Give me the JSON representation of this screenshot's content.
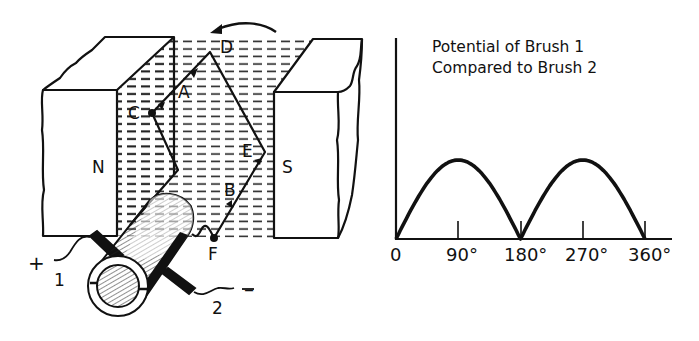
{
  "diagram": {
    "generator": {
      "magnets": {
        "north_label": "N",
        "south_label": "S"
      },
      "loop_points": {
        "A": "A",
        "B": "B",
        "C": "C",
        "D": "D",
        "E": "E",
        "F": "F"
      },
      "brushes": {
        "brush1_label": "1",
        "brush2_label": "2",
        "positive_sign": "+",
        "negative_sign": "–"
      },
      "rotation_arrow": "counterclockwise-arrow"
    },
    "colors": {
      "ink": "#111111",
      "background": "#ffffff"
    }
  },
  "chart_data": {
    "type": "line",
    "title": "Potential of Brush 1 Compared to Brush 2",
    "title_lines": [
      "Potential of Brush 1",
      "Compared to Brush 2"
    ],
    "xlabel": "",
    "ylabel": "",
    "x_ticks": [
      "0",
      "90°",
      "180°",
      "270°",
      "360°"
    ],
    "x": [
      0,
      30,
      60,
      90,
      120,
      150,
      180,
      210,
      240,
      270,
      300,
      330,
      360
    ],
    "series": [
      {
        "name": "Potential (rectified |sin|)",
        "values": [
          0,
          0.5,
          0.87,
          1,
          0.87,
          0.5,
          0,
          0.5,
          0.87,
          1,
          0.87,
          0.5,
          0
        ]
      }
    ],
    "xlim": [
      0,
      380
    ],
    "ylim": [
      0,
      2.5
    ],
    "grid": false,
    "legend": "none"
  }
}
